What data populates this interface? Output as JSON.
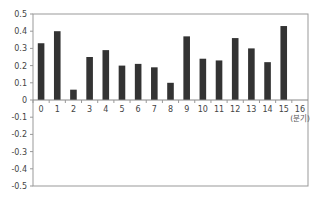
{
  "chart_data": {
    "type": "bar",
    "title": "",
    "xlabel": "(분기)",
    "ylabel": "",
    "categories": [
      "0",
      "1",
      "2",
      "3",
      "4",
      "5",
      "6",
      "7",
      "8",
      "9",
      "10",
      "11",
      "12",
      "13",
      "14",
      "15",
      "16"
    ],
    "values": [
      0.33,
      0.4,
      0.06,
      0.25,
      0.29,
      0.2,
      0.21,
      0.19,
      0.1,
      0.37,
      0.24,
      0.23,
      0.36,
      0.3,
      0.22,
      0.43,
      null
    ],
    "ylim": [
      -0.5,
      0.5
    ],
    "yticks": [
      "0.5",
      "0.4",
      "0.3",
      "0.2",
      "0.1",
      "0",
      "-0.1",
      "-0.2",
      "-0.3",
      "-0.4",
      "-0.5"
    ],
    "grid": false,
    "legend": null,
    "colors": {
      "bar": "#333333",
      "axis": "#888888",
      "text": "#444444"
    }
  }
}
